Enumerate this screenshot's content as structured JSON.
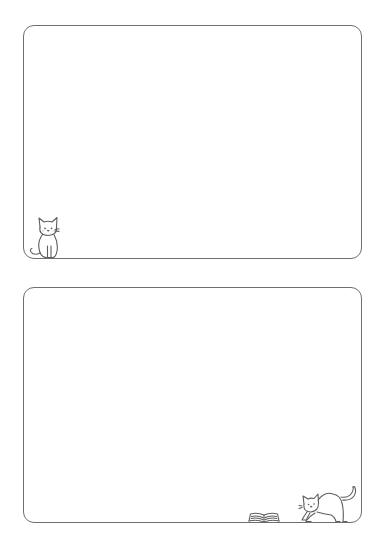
{
  "page": {
    "background_color": "#ffffff",
    "border_color": "#6f6f6f"
  },
  "frames": [
    {
      "id": "frame-top",
      "decoration": "sitting-cat-icon",
      "decoration_position": "bottom-left"
    },
    {
      "id": "frame-bottom",
      "decorations": [
        "open-book-icon",
        "stretching-cat-icon"
      ],
      "decoration_position": "bottom-right"
    }
  ]
}
